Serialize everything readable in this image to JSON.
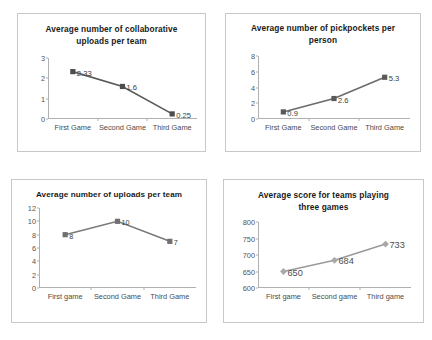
{
  "page": {
    "background": "#ffffff",
    "panel_border_color": "#c8c8c8"
  },
  "charts": [
    {
      "id": "collaborative-uploads",
      "title": "Average number of collaborative uploads per team",
      "title_line1": "Average number of collaborative",
      "title_line2": "uploads per team",
      "type": "line",
      "marker": "square",
      "series_color": "#595959",
      "marker_color": "#4d4d4d",
      "categories": [
        "First Game",
        "Second Game",
        "Third Game"
      ],
      "values": [
        2.33,
        1.6,
        0.25
      ],
      "point_labels": [
        "2.33",
        "1.6",
        "0.25"
      ],
      "yticks": [
        "0",
        "1",
        "2",
        "3"
      ],
      "ytick_values": [
        0,
        1,
        2,
        3
      ],
      "ylim": [
        0,
        3
      ],
      "xlabel": "",
      "ylabel": "",
      "grid": false,
      "legend": "none"
    },
    {
      "id": "pickpockets-per-person",
      "title": "Average number of pickpockets per person",
      "title_line1": "Average number of pickpockets per",
      "title_line2": "person",
      "type": "line",
      "marker": "square",
      "series_color": "#6b6b6b",
      "marker_color": "#5a5a5a",
      "categories": [
        "First Game",
        "Second Game",
        "Third Game"
      ],
      "values": [
        0.9,
        2.6,
        5.3
      ],
      "point_labels": [
        "0.9",
        "2.6",
        "5.3"
      ],
      "yticks": [
        "0",
        "2",
        "4",
        "6",
        "8"
      ],
      "ytick_values": [
        0,
        2,
        4,
        6,
        8
      ],
      "ylim": [
        0,
        8
      ],
      "xlabel": "",
      "ylabel": "",
      "grid": false,
      "legend": "none"
    },
    {
      "id": "uploads-per-team",
      "title": "Average number of uploads per team",
      "title_line1": "Average number of uploads per team",
      "title_line2": "",
      "type": "line",
      "marker": "square",
      "series_color": "#7a7a7a",
      "marker_color": "#707070",
      "categories": [
        "First game",
        "Second Game",
        "Third Game"
      ],
      "values": [
        8,
        10,
        7
      ],
      "point_labels": [
        "8",
        "10",
        "7"
      ],
      "yticks": [
        "0",
        "2",
        "4",
        "6",
        "8",
        "10",
        "12"
      ],
      "ytick_values": [
        0,
        2,
        4,
        6,
        8,
        10,
        12
      ],
      "ylim": [
        0,
        12
      ],
      "xlabel": "",
      "ylabel": "",
      "grid": false,
      "legend": "none"
    },
    {
      "id": "average-score-three-games",
      "title": "Average score for teams playing three games",
      "title_line1": "Average score for teams playing",
      "title_line2": "three games",
      "type": "line",
      "marker": "diamond",
      "series_color": "#9a9a9a",
      "marker_color": "#a8a8a8",
      "categories": [
        "First game",
        "Second game",
        "Third game"
      ],
      "values": [
        650,
        684,
        733
      ],
      "point_labels": [
        "650",
        "684",
        "733"
      ],
      "yticks": [
        "600",
        "650",
        "700",
        "750",
        "800"
      ],
      "ytick_values": [
        600,
        650,
        700,
        750,
        800
      ],
      "ylim": [
        600,
        800
      ],
      "xlabel": "",
      "ylabel": "",
      "grid": false,
      "legend": "none"
    }
  ],
  "chart_data": [
    {
      "type": "line",
      "title": "Average number of collaborative uploads per team",
      "categories": [
        "First Game",
        "Second Game",
        "Third Game"
      ],
      "values": [
        2.33,
        1.6,
        0.25
      ],
      "xlabel": "",
      "ylabel": "",
      "ylim": [
        0,
        3
      ],
      "yticks": [
        0,
        1,
        2,
        3
      ],
      "grid": false,
      "legend": "none",
      "data_labels": [
        "2.33",
        "1.6",
        "0.25"
      ]
    },
    {
      "type": "line",
      "title": "Average number of pickpockets per person",
      "categories": [
        "First Game",
        "Second Game",
        "Third Game"
      ],
      "values": [
        0.9,
        2.6,
        5.3
      ],
      "xlabel": "",
      "ylabel": "",
      "ylim": [
        0,
        8
      ],
      "yticks": [
        0,
        2,
        4,
        6,
        8
      ],
      "grid": false,
      "legend": "none",
      "data_labels": [
        "0.9",
        "2.6",
        "5.3"
      ]
    },
    {
      "type": "line",
      "title": "Average number of uploads per team",
      "categories": [
        "First game",
        "Second Game",
        "Third Game"
      ],
      "values": [
        8,
        10,
        7
      ],
      "xlabel": "",
      "ylabel": "",
      "ylim": [
        0,
        12
      ],
      "yticks": [
        0,
        2,
        4,
        6,
        8,
        10,
        12
      ],
      "grid": false,
      "legend": "none",
      "data_labels": [
        "8",
        "10",
        "7"
      ]
    },
    {
      "type": "line",
      "title": "Average score for teams playing three games",
      "categories": [
        "First game",
        "Second game",
        "Third game"
      ],
      "values": [
        650,
        684,
        733
      ],
      "xlabel": "",
      "ylabel": "",
      "ylim": [
        600,
        800
      ],
      "yticks": [
        600,
        650,
        700,
        750,
        800
      ],
      "grid": false,
      "legend": "none",
      "data_labels": [
        "650",
        "684",
        "733"
      ]
    }
  ]
}
